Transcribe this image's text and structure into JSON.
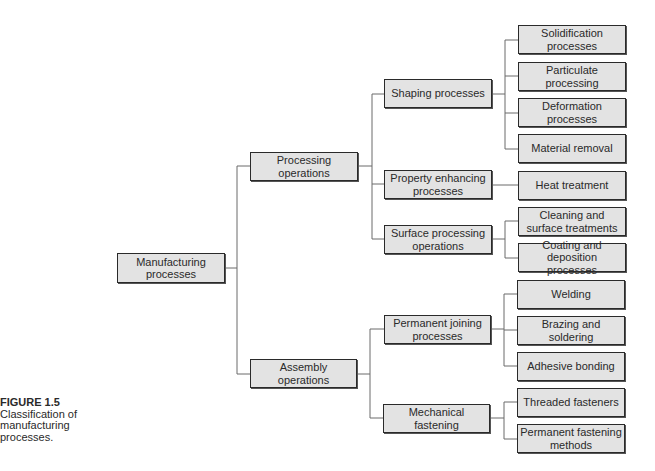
{
  "diagram": {
    "root": "Manufacturing processes",
    "nodes": {
      "manufacturing": "Manufacturing processes",
      "processing": "Processing operations",
      "assembly": "Assembly operations",
      "shaping": "Shaping processes",
      "property": "Property enhancing processes",
      "surface": "Surface processing operations",
      "permanent_joining": "Permanent joining processes",
      "mechanical": "Mechanical fastening",
      "solidification": "Solidification processes",
      "particulate": "Particulate processing",
      "deformation": "Deformation processes",
      "material_removal": "Material removal",
      "heat": "Heat treatment",
      "cleaning": "Cleaning and surface treatments",
      "coating": "Coating and deposition processes",
      "welding": "Welding",
      "brazing": "Brazing and soldering",
      "adhesive": "Adhesive bonding",
      "threaded": "Threaded fasteners",
      "permanent_fastening": "Permanent fastening methods"
    },
    "edges": [
      [
        "manufacturing",
        "processing"
      ],
      [
        "manufacturing",
        "assembly"
      ],
      [
        "processing",
        "shaping"
      ],
      [
        "processing",
        "property"
      ],
      [
        "processing",
        "surface"
      ],
      [
        "shaping",
        "solidification"
      ],
      [
        "shaping",
        "particulate"
      ],
      [
        "shaping",
        "deformation"
      ],
      [
        "shaping",
        "material_removal"
      ],
      [
        "property",
        "heat"
      ],
      [
        "surface",
        "cleaning"
      ],
      [
        "surface",
        "coating"
      ],
      [
        "assembly",
        "permanent_joining"
      ],
      [
        "assembly",
        "mechanical"
      ],
      [
        "permanent_joining",
        "welding"
      ],
      [
        "permanent_joining",
        "brazing"
      ],
      [
        "permanent_joining",
        "adhesive"
      ],
      [
        "mechanical",
        "threaded"
      ],
      [
        "mechanical",
        "permanent_fastening"
      ]
    ]
  },
  "caption": {
    "figure_label": "FIGURE 1.5",
    "text_line1": "Classification of",
    "text_line2": "manufacturing",
    "text_line3": "processes."
  }
}
